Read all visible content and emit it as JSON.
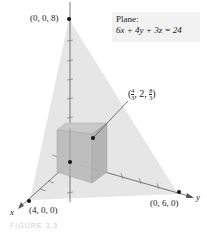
{
  "figure": {
    "legend": {
      "title": "Plane:",
      "equation": "6x + 4y + 3z = 24"
    },
    "points": {
      "z_intercept": "(0, 0, 8)",
      "x_intercept": "(4, 0, 0)",
      "y_intercept": "(0, 6, 0)",
      "box_corner": {
        "prefix": "(",
        "x_num": "4",
        "x_den": "3",
        "y": "2",
        "z_num": "8",
        "z_den": "3",
        "suffix": ")"
      }
    },
    "axes": {
      "x_label": "x",
      "y_label": "y"
    },
    "caption": "FIGURE 3.3",
    "colors": {
      "plane": "#e4e4e4",
      "box": "#bdbdbd",
      "box_edge": "#9a9a9a",
      "axis": "#555555",
      "point": "#111111"
    }
  }
}
